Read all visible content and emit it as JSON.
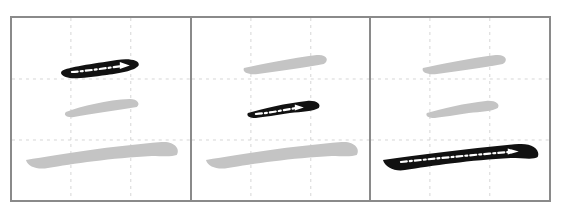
{
  "diagram": {
    "character": "三",
    "type": "stroke-order",
    "stroke_count": 3,
    "colors": {
      "frame": "#8a8a8a",
      "guide": "#d6d6d6",
      "completed_stroke": "#c4c4c4",
      "current_stroke": "#111111",
      "direction_arrow": "#ffffff"
    },
    "steps": [
      {
        "step": 1,
        "label": "Stroke 1: top horizontal (横)",
        "current_stroke": "top"
      },
      {
        "step": 2,
        "label": "Stroke 2: middle horizontal (横)",
        "current_stroke": "middle"
      },
      {
        "step": 3,
        "label": "Stroke 3: bottom horizontal (横)",
        "current_stroke": "bottom"
      }
    ]
  }
}
